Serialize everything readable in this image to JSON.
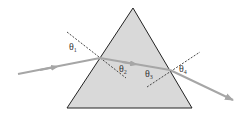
{
  "diagram": {
    "type": "prism-refraction",
    "colors": {
      "prism_fill": "#d9d9d9",
      "prism_stroke": "#222222",
      "ray": "#a6a6a6",
      "normal": "#333333",
      "background": "#ffffff"
    },
    "labels": {
      "theta1": {
        "symbol": "θ",
        "sub": "1"
      },
      "theta2": {
        "symbol": "θ",
        "sub": "2"
      },
      "theta3": {
        "symbol": "θ",
        "sub": "3"
      },
      "theta4": {
        "symbol": "θ",
        "sub": "4"
      }
    }
  }
}
